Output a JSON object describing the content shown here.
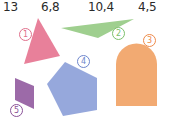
{
  "numbers": [
    "13",
    "6,8",
    "10,4",
    "4,5"
  ],
  "shapes": [
    {
      "id": "1",
      "kind": "triangle",
      "color": "#e8809a",
      "label_color": "#e0708c"
    },
    {
      "id": "2",
      "kind": "triangle",
      "color": "#9fcf8f",
      "label_color": "#7cc06c"
    },
    {
      "id": "3",
      "kind": "arch",
      "color": "#f2aa72",
      "label_color": "#ee8a4a"
    },
    {
      "id": "4",
      "kind": "pentagon",
      "color": "#96a8dc",
      "label_color": "#6e86cc"
    },
    {
      "id": "5",
      "kind": "parallelogram",
      "color": "#9c6aa8",
      "label_color": "#8a5298"
    }
  ]
}
